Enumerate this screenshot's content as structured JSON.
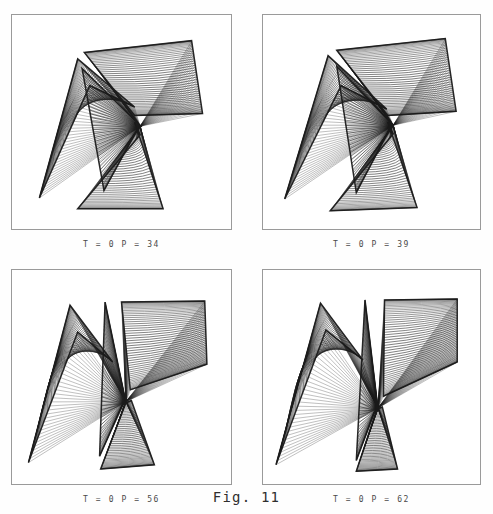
{
  "page": {
    "running_head": "A F T E R   B R E A K I N G",
    "figure_label": "Fig. 11",
    "background_color": "#fefefe",
    "ink_color": "#1b1b1b",
    "border_color": "#9a9a9a"
  },
  "panels": [
    {
      "id": "panel-1",
      "caption": "T = 0   P = 34",
      "T": 0,
      "P": 34,
      "position": "top-left"
    },
    {
      "id": "panel-2",
      "caption": "T = 0   P = 39",
      "T": 0,
      "P": 39,
      "position": "top-right"
    },
    {
      "id": "panel-3",
      "caption": "T = 0   P = 56",
      "T": 0,
      "P": 56,
      "position": "bottom-left"
    },
    {
      "id": "panel-4",
      "caption": "T = 0   P = 62",
      "T": 0,
      "P": 62,
      "position": "bottom-right"
    }
  ],
  "chart_data": {
    "type": "line",
    "title": "Fig. 11",
    "subtitle": "Ruled-surface (caustic) projections of a folding sheet",
    "xlabel": "",
    "ylabel": "",
    "grid": false,
    "legend": "none",
    "panel_count": 4,
    "panels": [
      {
        "label": "T = 0   P = 34",
        "T": 0,
        "P": 34,
        "ruling_count": 46,
        "sheets": [
          {
            "name": "left-lobe",
            "a0": [
              0.125,
              0.855
            ],
            "a1": [
              0.355,
              0.33
            ],
            "b0": [
              0.3,
              0.205
            ],
            "b1": [
              0.56,
              0.43
            ],
            "bow": -0.085
          },
          {
            "name": "upper-right-lobe",
            "a0": [
              0.33,
              0.175
            ],
            "a1": [
              0.56,
              0.47
            ],
            "b0": [
              0.82,
              0.12
            ],
            "b1": [
              0.87,
              0.46
            ],
            "bow": 0.055
          },
          {
            "name": "lower-fan",
            "a0": [
              0.3,
              0.905
            ],
            "a1": [
              0.585,
              0.56
            ],
            "b0": [
              0.69,
              0.905
            ],
            "b1": [
              0.56,
              0.5
            ],
            "bow": 0.04
          },
          {
            "name": "mid-fold",
            "a0": [
              0.32,
              0.25
            ],
            "a1": [
              0.42,
              0.82
            ],
            "b0": [
              0.59,
              0.52
            ],
            "b1": [
              0.575,
              0.53
            ],
            "bow": 0.0
          }
        ],
        "cusp": [
          0.585,
          0.52
        ]
      },
      {
        "label": "T = 0   P = 39",
        "T": 0,
        "P": 39,
        "ruling_count": 48,
        "sheets": [
          {
            "name": "left-lobe",
            "a0": [
              0.1,
              0.86
            ],
            "a1": [
              0.36,
              0.33
            ],
            "b0": [
              0.3,
              0.19
            ],
            "b1": [
              0.57,
              0.44
            ],
            "bow": -0.09
          },
          {
            "name": "upper-right-lobe",
            "a0": [
              0.34,
              0.165
            ],
            "a1": [
              0.575,
              0.47
            ],
            "b0": [
              0.84,
              0.11
            ],
            "b1": [
              0.89,
              0.45
            ],
            "bow": 0.06
          },
          {
            "name": "lower-fan",
            "a0": [
              0.31,
              0.915
            ],
            "a1": [
              0.6,
              0.555
            ],
            "b0": [
              0.71,
              0.9
            ],
            "b1": [
              0.575,
              0.5
            ],
            "bow": 0.045
          },
          {
            "name": "mid-fold",
            "a0": [
              0.34,
              0.24
            ],
            "a1": [
              0.43,
              0.83
            ],
            "b0": [
              0.6,
              0.515
            ],
            "b1": [
              0.585,
              0.53
            ],
            "bow": 0.0
          }
        ],
        "cusp": [
          0.6,
          0.515
        ]
      },
      {
        "label": "T = 0   P = 56",
        "T": 0,
        "P": 56,
        "ruling_count": 52,
        "sheets": [
          {
            "name": "left-lobe",
            "a0": [
              0.075,
              0.9
            ],
            "a1": [
              0.3,
              0.29
            ],
            "b0": [
              0.265,
              0.165
            ],
            "b1": [
              0.46,
              0.43
            ],
            "bow": -0.105
          },
          {
            "name": "upper-right-lobe",
            "a0": [
              0.5,
              0.15
            ],
            "a1": [
              0.54,
              0.56
            ],
            "b0": [
              0.88,
              0.145
            ],
            "b1": [
              0.89,
              0.44
            ],
            "bow": 0.05
          },
          {
            "name": "lower-fan",
            "a0": [
              0.405,
              0.93
            ],
            "a1": [
              0.52,
              0.62
            ],
            "b0": [
              0.65,
              0.91
            ],
            "b1": [
              0.545,
              0.61
            ],
            "bow": 0.035
          },
          {
            "name": "mid-fold",
            "a0": [
              0.425,
              0.15
            ],
            "a1": [
              0.4,
              0.87
            ],
            "b0": [
              0.52,
              0.62
            ],
            "b1": [
              0.505,
              0.63
            ],
            "bow": 0.0
          }
        ],
        "cusp": [
          0.52,
          0.615
        ]
      },
      {
        "label": "T = 0   P = 62",
        "T": 0,
        "P": 62,
        "ruling_count": 54,
        "sheets": [
          {
            "name": "left-lobe",
            "a0": [
              0.06,
              0.91
            ],
            "a1": [
              0.29,
              0.28
            ],
            "b0": [
              0.265,
              0.155
            ],
            "b1": [
              0.46,
              0.42
            ],
            "bow": -0.115
          },
          {
            "name": "upper-right-lobe",
            "a0": [
              0.56,
              0.14
            ],
            "a1": [
              0.555,
              0.59
            ],
            "b0": [
              0.895,
              0.135
            ],
            "b1": [
              0.895,
              0.43
            ],
            "bow": 0.048
          },
          {
            "name": "lower-fan",
            "a0": [
              0.43,
              0.94
            ],
            "a1": [
              0.525,
              0.65
            ],
            "b0": [
              0.62,
              0.93
            ],
            "b1": [
              0.55,
              0.64
            ],
            "bow": 0.03
          },
          {
            "name": "mid-fold",
            "a0": [
              0.47,
              0.14
            ],
            "a1": [
              0.43,
              0.89
            ],
            "b0": [
              0.53,
              0.65
            ],
            "b1": [
              0.515,
              0.66
            ],
            "bow": 0.0
          }
        ],
        "cusp": [
          0.53,
          0.645
        ]
      }
    ]
  }
}
